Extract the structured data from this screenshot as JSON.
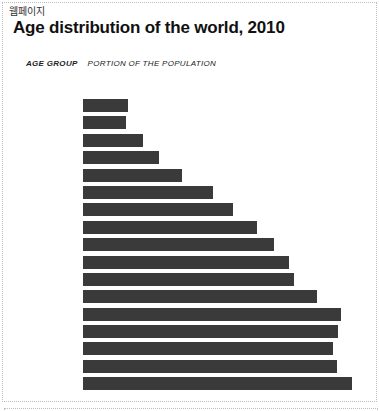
{
  "embed": {
    "type_label": "웹페이지"
  },
  "colors": {
    "bar": "#3a3a3a",
    "border": "#bdbdbd",
    "title_text": "#111111"
  },
  "chart_data": {
    "type": "bar",
    "orientation": "horizontal",
    "title": "Age distribution of the world, 2010",
    "column_headers": {
      "age_group": "AGE GROUP",
      "portion": "PORTION OF THE POPULATION"
    },
    "bar_count": 17,
    "category_labels_visible": false,
    "value_axis_visible": false,
    "grid": false,
    "legend": false,
    "bar_lengths_px": [
      45,
      43,
      60,
      76,
      99,
      130,
      150,
      174,
      191,
      206,
      211,
      234,
      258,
      255,
      250,
      254,
      269
    ],
    "max_bar_length_px": 269
  }
}
